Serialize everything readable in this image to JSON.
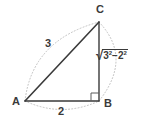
{
  "figure": {
    "type": "right-triangle-diagram",
    "background_color": "#ffffff",
    "stroke_color": "#3a3a3a",
    "dotted_arc_color": "#b8b8b8",
    "vertices": {
      "a_label": "A",
      "b_label": "B",
      "c_label": "C",
      "a_point": [
        25,
        101
      ],
      "b_point": [
        99,
        101
      ],
      "c_point": [
        99,
        22
      ]
    },
    "sides": {
      "hypotenuse_label": "3",
      "base_label": "2",
      "vertical_label_radical": "√",
      "vertical_label_base_1": "3",
      "vertical_label_exp_1": "2",
      "vertical_label_operator": "−",
      "vertical_label_base_2": "2",
      "vertical_label_exp_2": "2",
      "vertical_label_full": "√(3²−2²)"
    },
    "right_angle": {
      "at_vertex": "B",
      "marker": "square"
    },
    "arcs": {
      "arc_a_to_c": "dotted",
      "arc_c_to_b": "dotted",
      "arc_a_to_b": "dotted"
    }
  }
}
